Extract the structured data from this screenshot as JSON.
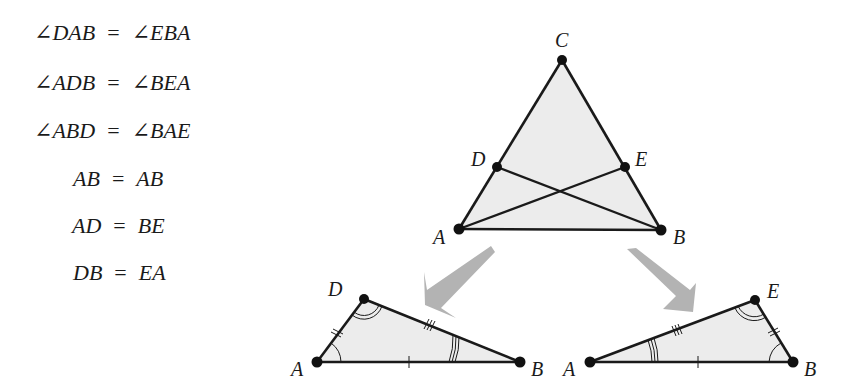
{
  "equations": [
    {
      "lhs": "∠DAB",
      "op": "=",
      "rhs": "∠EBA"
    },
    {
      "lhs": "∠ADB",
      "op": "=",
      "rhs": "∠BEA"
    },
    {
      "lhs": "∠ABD",
      "op": "=",
      "rhs": "∠BAE"
    },
    {
      "lhs": "AB",
      "op": "=",
      "rhs": "AB"
    },
    {
      "lhs": "AD",
      "op": "=",
      "rhs": "BE"
    },
    {
      "lhs": "DB",
      "op": "=",
      "rhs": "EA"
    }
  ],
  "main_triangle": {
    "labels": {
      "C": "C",
      "D": "D",
      "E": "E",
      "A": "A",
      "B": "B"
    }
  },
  "left_triangle": {
    "labels": {
      "D": "D",
      "A": "A",
      "B": "B"
    }
  },
  "right_triangle": {
    "labels": {
      "E": "E",
      "A": "A",
      "B": "B"
    }
  },
  "colors": {
    "fill": "#ececec",
    "stroke": "#1a1a1a",
    "arrow": "#b3b3b3"
  }
}
